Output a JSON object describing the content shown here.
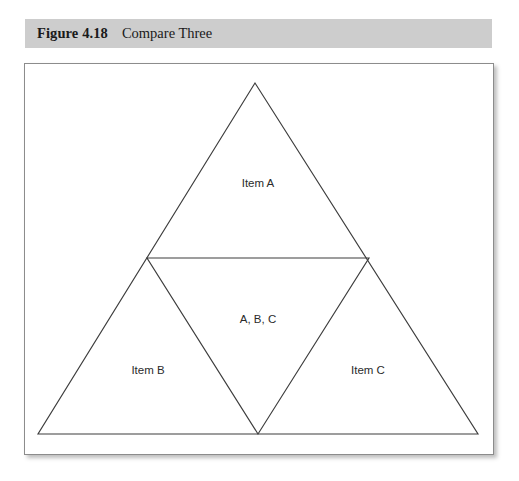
{
  "caption": {
    "number": "Figure 4.18",
    "title": "Compare Three"
  },
  "colors": {
    "caption_bar_bg": "#cdcdcd",
    "caption_text": "#1a1a1a",
    "figure_border": "#8c8c8c",
    "figure_bg": "#ffffff",
    "line_stroke": "#3d3d3d",
    "label_text": "#2b2b2b"
  },
  "diagram": {
    "type": "venn-triangle",
    "outer_triangle": {
      "apex": [
        231,
        20
      ],
      "bottom_left": [
        14,
        371
      ],
      "bottom_right": [
        454,
        371
      ]
    },
    "inner_triangle": {
      "left": [
        123,
        195
      ],
      "right": [
        345,
        195
      ],
      "bottom": [
        234,
        371
      ]
    },
    "midline": {
      "start": [
        123,
        195
      ],
      "end": [
        345,
        195
      ]
    },
    "labels": [
      {
        "id": "item-a",
        "text": "Item A",
        "x": 234,
        "y": 121
      },
      {
        "id": "shared-abc",
        "text": "A, B, C",
        "x": 234,
        "y": 257
      },
      {
        "id": "item-b",
        "text": "Item B",
        "x": 124,
        "y": 308
      },
      {
        "id": "item-c",
        "text": "Item C",
        "x": 344,
        "y": 308
      }
    ]
  }
}
